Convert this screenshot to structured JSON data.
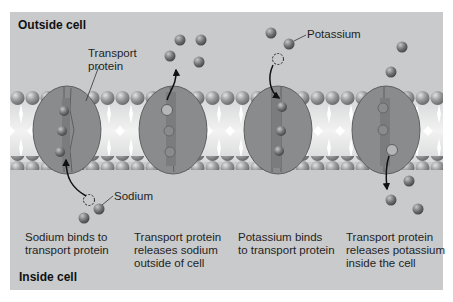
{
  "regions": {
    "outside": "Outside cell",
    "inside": "Inside cell"
  },
  "labels": {
    "transport_protein": [
      "Transport",
      "protein"
    ],
    "sodium": "Sodium",
    "potassium": "Potassium"
  },
  "steps": [
    {
      "lines": [
        "Sodium binds to",
        "transport protein"
      ]
    },
    {
      "lines": [
        "Transport protein",
        "releases sodium",
        "outside of cell"
      ]
    },
    {
      "lines": [
        "Potassium binds",
        "to transport protein"
      ]
    },
    {
      "lines": [
        "Transport protein",
        "releases potassium",
        "inside the cell"
      ]
    }
  ],
  "colors": {
    "background": "#c9cacb",
    "membrane_head": "#8e8f90",
    "protein": "#8a8b8c",
    "ion": "#6f7173"
  }
}
